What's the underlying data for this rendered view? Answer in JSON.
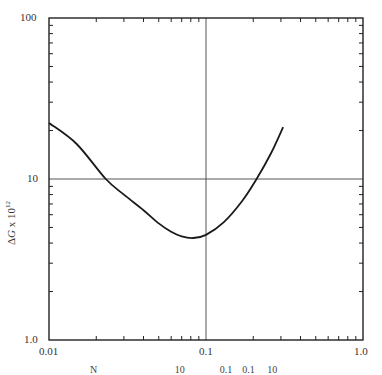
{
  "chart_data": {
    "type": "line",
    "title": "",
    "xlabel": "Number concentration (partially visible, cut off at bottom)",
    "ylabel_parts": {
      "delta": "Δ",
      "var": "G",
      "times": " x 10",
      "exp": "12"
    },
    "xscale": "log",
    "yscale": "log",
    "xlim": [
      0.01,
      1.0
    ],
    "ylim": [
      1.0,
      100
    ],
    "x_tick_labels": [
      "0.01",
      "0.1",
      "1.0"
    ],
    "y_tick_labels": [
      "1.0",
      "10",
      "100"
    ],
    "gridlines": {
      "x": [
        0.1
      ],
      "y": [
        10
      ]
    },
    "grid": false,
    "legend": null,
    "series": [
      {
        "name": "ΔG curve",
        "x": [
          0.01,
          0.015,
          0.023,
          0.03,
          0.04,
          0.05,
          0.06,
          0.07,
          0.083,
          0.1,
          0.13,
          0.17,
          0.21,
          0.26,
          0.31
        ],
        "values": [
          22.3,
          16.5,
          10.0,
          8.0,
          6.4,
          5.3,
          4.7,
          4.4,
          4.3,
          4.5,
          5.4,
          7.3,
          10.0,
          14.5,
          21.0
        ]
      }
    ]
  },
  "labels": {
    "y100": "100",
    "y10": "10",
    "y1": "1.0",
    "x001": "0.01",
    "x01": "0.1",
    "x1": "1.0",
    "caption": "N                               10              0.1    0.1     10"
  },
  "colors": {
    "axis": "#222222",
    "grid": "#555555",
    "curve": "#1a1a1a"
  }
}
